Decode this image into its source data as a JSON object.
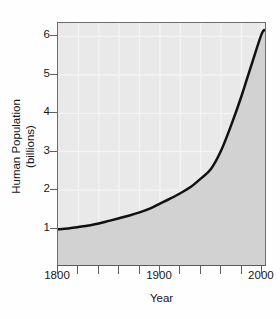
{
  "figure": {
    "background_color": "#fefefe",
    "plot_background_color": "#e9e9e9",
    "fill_color": "#d2d2d2",
    "line_color": "#111111",
    "grid_color": "#f4f4f4",
    "axis_color": "#5f5f5f"
  },
  "axes": {
    "y_title_line1": "Human Population",
    "y_title_line2": "(billions)",
    "x_title": "Year",
    "y_ticklabels": [
      "1",
      "2",
      "3",
      "4",
      "5",
      "6"
    ],
    "x_ticklabels": [
      "1800",
      "1900",
      "2000"
    ]
  },
  "chart_data": {
    "type": "line",
    "title": "",
    "subtitle": "",
    "xlabel": "Year",
    "ylabel": "Human Population (billions)",
    "xlim": [
      1800,
      2005
    ],
    "ylim": [
      0.0,
      6.35
    ],
    "yticks": [
      1,
      2,
      3,
      4,
      5,
      6
    ],
    "ytick_labels": [
      "1",
      "2",
      "3",
      "4",
      "5",
      "6"
    ],
    "xticks": [
      1800,
      1820,
      1840,
      1860,
      1880,
      1900,
      1920,
      1940,
      1960,
      1980,
      2000
    ],
    "xtick_labels": [
      "1800",
      "",
      "",
      "",
      "",
      "1900",
      "",
      "",
      "",
      "",
      "2000"
    ],
    "grid": true,
    "grid_color": "#f4f4f4",
    "legend": false,
    "legend_position": "none",
    "fill_under_curve": true,
    "series": [
      {
        "name": "Human Population",
        "line_color": "#111111",
        "line_width": 2.5,
        "x": [
          1800,
          1810,
          1820,
          1830,
          1840,
          1850,
          1860,
          1870,
          1880,
          1890,
          1900,
          1910,
          1920,
          1930,
          1940,
          1950,
          1960,
          1970,
          1980,
          1990,
          2000,
          2004
        ],
        "values": [
          0.98,
          1.0,
          1.04,
          1.08,
          1.13,
          1.2,
          1.27,
          1.34,
          1.42,
          1.52,
          1.65,
          1.78,
          1.92,
          2.08,
          2.3,
          2.55,
          3.03,
          3.7,
          4.45,
          5.28,
          6.08,
          6.15
        ]
      }
    ],
    "annotations": [
      {
        "text": "Population remains near 1 billion through the early 1800s",
        "x": 1800,
        "y": 1.0
      },
      {
        "text": "Exponential rise after 1950 reaching about 6 billion by 2000",
        "x": 2000,
        "y": 6.08
      }
    ]
  }
}
